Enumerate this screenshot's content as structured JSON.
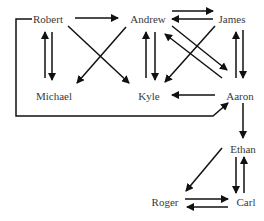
{
  "diagram": {
    "type": "directed-graph",
    "colors": {
      "edge": "#111111",
      "label": "#3a3a3a",
      "background": "#ffffff"
    },
    "nodes": [
      {
        "id": "robert",
        "label": "Robert",
        "x": 48,
        "y": 19
      },
      {
        "id": "andrew",
        "label": "Andrew",
        "x": 148,
        "y": 19
      },
      {
        "id": "james",
        "label": "James",
        "x": 232,
        "y": 19
      },
      {
        "id": "michael",
        "label": "Michael",
        "x": 54,
        "y": 96
      },
      {
        "id": "kyle",
        "label": "Kyle",
        "x": 149,
        "y": 96
      },
      {
        "id": "aaron",
        "label": "Aaron",
        "x": 240,
        "y": 96
      },
      {
        "id": "ethan",
        "label": "Ethan",
        "x": 243,
        "y": 149
      },
      {
        "id": "roger",
        "label": "Roger",
        "x": 165,
        "y": 202
      },
      {
        "id": "carl",
        "label": "Carl",
        "x": 246,
        "y": 202
      }
    ],
    "edges": [
      {
        "from": "Robert",
        "to": "Andrew"
      },
      {
        "from": "Robert",
        "to": "Michael"
      },
      {
        "from": "Michael",
        "to": "Robert"
      },
      {
        "from": "Robert",
        "to": "Kyle"
      },
      {
        "from": "Andrew",
        "to": "Michael"
      },
      {
        "from": "Andrew",
        "to": "James"
      },
      {
        "from": "James",
        "to": "Andrew"
      },
      {
        "from": "Andrew",
        "to": "Kyle"
      },
      {
        "from": "Kyle",
        "to": "Andrew"
      },
      {
        "from": "Andrew",
        "to": "Aaron"
      },
      {
        "from": "Aaron",
        "to": "Andrew"
      },
      {
        "from": "James",
        "to": "Kyle"
      },
      {
        "from": "James",
        "to": "Aaron"
      },
      {
        "from": "Aaron",
        "to": "James"
      },
      {
        "from": "Aaron",
        "to": "Kyle"
      },
      {
        "from": "Robert",
        "to": "Aaron",
        "routing": "left-bottom-loop"
      },
      {
        "from": "Aaron",
        "to": "Ethan"
      },
      {
        "from": "Ethan",
        "to": "Roger"
      },
      {
        "from": "Ethan",
        "to": "Carl"
      },
      {
        "from": "Carl",
        "to": "Ethan"
      },
      {
        "from": "Roger",
        "to": "Carl"
      },
      {
        "from": "Carl",
        "to": "Roger"
      }
    ]
  }
}
